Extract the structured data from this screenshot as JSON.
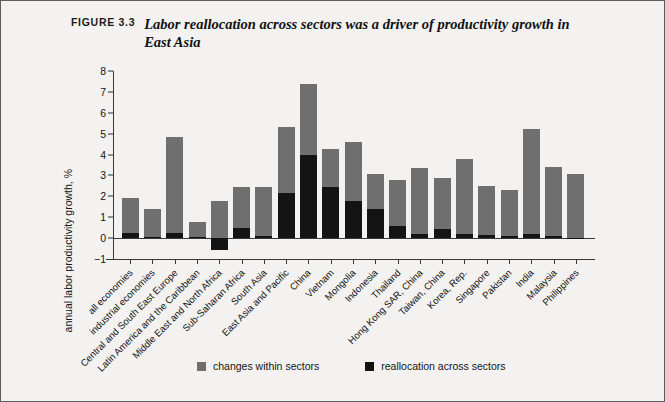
{
  "figure": {
    "number_label": "FIGURE 3.3",
    "caption": "Labor reallocation across sectors was a driver of productivity growth in East Asia"
  },
  "legend": {
    "position": "bottom-center",
    "items": [
      {
        "label": "changes within sectors",
        "color": "#6f6f6f",
        "swatch": "square-swatch"
      },
      {
        "label": "reallocation across sectors",
        "color": "#141414",
        "swatch": "square-swatch"
      }
    ]
  },
  "chart_data": {
    "type": "bar",
    "title": "Labor reallocation across sectors was a driver of productivity growth in East Asia",
    "xlabel": "",
    "ylabel": "annual labor productivity growth, %",
    "ylim": [
      -1,
      8
    ],
    "yticks": [
      -1,
      0,
      1,
      2,
      3,
      4,
      5,
      6,
      7,
      8
    ],
    "ytick_labels": [
      "−1",
      "0",
      "1",
      "2",
      "3",
      "4",
      "5",
      "6",
      "7",
      "8"
    ],
    "grid": false,
    "stacked": true,
    "categories": [
      "all economies",
      "industrial economies",
      "Central and South East Europe",
      "Latin America and the Caribbean",
      "Middle East and North Africa",
      "Sub-Saharan Africa",
      "South Asia",
      "East Asia and Pacific",
      "China",
      "Vietnam",
      "Mongolia",
      "Indonesia",
      "Thailand",
      "Hong Kong SAR, China",
      "Taiwan, China",
      "Korea, Rep.",
      "Singapore",
      "Pakistan",
      "India",
      "Malaysia",
      "Philippines"
    ],
    "series": [
      {
        "name": "reallocation across sectors",
        "color": "#141414",
        "values": [
          0.25,
          0.05,
          0.25,
          0.05,
          -0.55,
          0.5,
          0.1,
          2.15,
          4.0,
          2.45,
          1.8,
          1.4,
          0.6,
          0.2,
          0.45,
          0.2,
          0.15,
          0.1,
          0.2,
          0.1,
          0.0
        ]
      },
      {
        "name": "changes within sectors",
        "color": "#6f6f6f",
        "values": [
          1.65,
          1.35,
          4.6,
          0.7,
          1.8,
          1.95,
          2.35,
          3.15,
          3.4,
          1.8,
          2.8,
          1.65,
          2.2,
          3.15,
          2.45,
          3.6,
          2.35,
          2.2,
          5.0,
          3.3,
          3.05
        ]
      }
    ],
    "totals": [
      1.9,
      1.4,
      4.85,
      0.75,
      1.8,
      2.45,
      2.45,
      5.3,
      7.4,
      4.25,
      4.6,
      3.05,
      2.8,
      3.35,
      2.9,
      3.8,
      2.5,
      2.3,
      5.2,
      3.4,
      3.05
    ]
  }
}
